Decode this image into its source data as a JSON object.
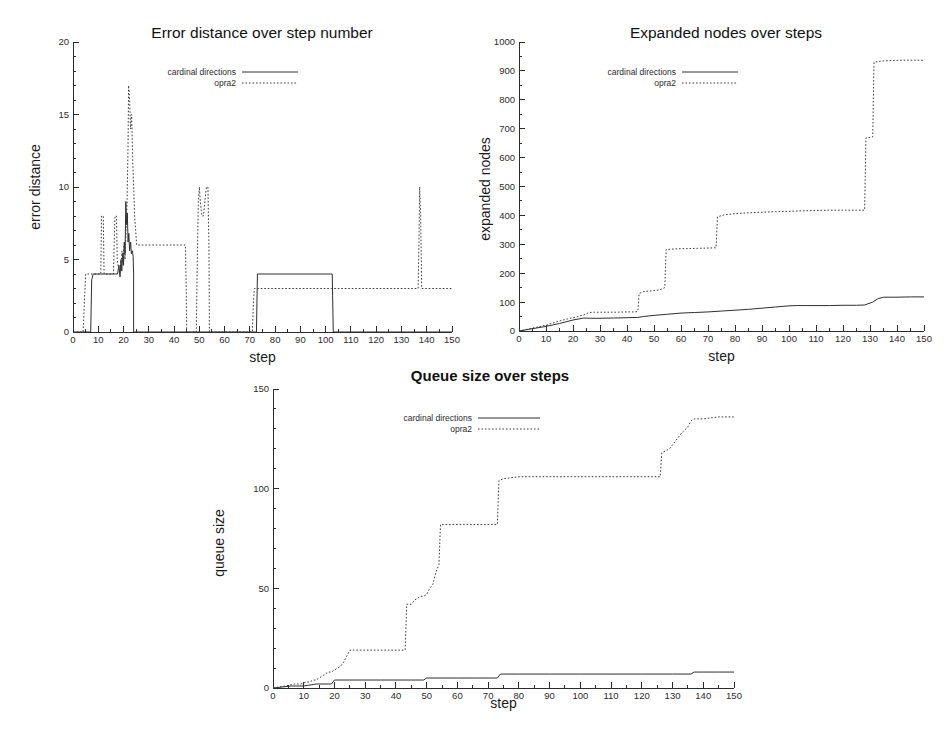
{
  "page": {
    "kind": "figure-sheet",
    "background": "#ffffff",
    "ink_color": "#2b2b2b"
  },
  "legend_common": {
    "entries": [
      {
        "label": "cardinal directions",
        "style": "solid"
      },
      {
        "label": "opra2",
        "style": "dotted"
      }
    ]
  },
  "chart_data": [
    {
      "id": "error-distance",
      "type": "line",
      "title": "Error distance over step number",
      "title_bold": false,
      "xlabel": "step",
      "ylabel": "error distance",
      "xlim": [
        0,
        150
      ],
      "ylim": [
        0,
        20
      ],
      "x_major_step": 10,
      "x_minor_step": 5,
      "y_major_step": 5,
      "y_minor_step": 1,
      "grid": false,
      "legend_position": "top-left",
      "series": [
        {
          "name": "cardinal directions",
          "style": "solid",
          "points": [
            [
              0,
              0
            ],
            [
              7,
              0
            ],
            [
              7.4,
              3.6
            ],
            [
              8,
              4
            ],
            [
              17,
              4
            ],
            [
              17.6,
              4
            ],
            [
              18.2,
              4.6
            ],
            [
              18.6,
              3.8
            ],
            [
              19,
              5
            ],
            [
              19.3,
              4.2
            ],
            [
              19.7,
              5.4
            ],
            [
              20,
              4.6
            ],
            [
              20.3,
              6.2
            ],
            [
              20.6,
              5.4
            ],
            [
              20.9,
              9
            ],
            [
              21.2,
              7.4
            ],
            [
              21.5,
              8.2
            ],
            [
              21.8,
              6.2
            ],
            [
              22.1,
              6.8
            ],
            [
              22.4,
              5.6
            ],
            [
              22.8,
              6.2
            ],
            [
              23.1,
              5.4
            ],
            [
              23.5,
              5.6
            ],
            [
              23.8,
              5.2
            ],
            [
              24,
              4
            ],
            [
              24,
              0
            ],
            [
              72.6,
              0
            ],
            [
              73,
              4
            ],
            [
              102,
              4
            ],
            [
              102.6,
              4
            ],
            [
              103,
              0
            ],
            [
              150,
              0
            ]
          ]
        },
        {
          "name": "opra2",
          "style": "dotted",
          "points": [
            [
              0,
              0
            ],
            [
              4,
              0
            ],
            [
              4.5,
              2
            ],
            [
              5,
              4
            ],
            [
              11,
              4
            ],
            [
              11.3,
              8
            ],
            [
              12,
              8
            ],
            [
              12.3,
              4
            ],
            [
              16,
              4
            ],
            [
              16.3,
              6
            ],
            [
              16.6,
              8
            ],
            [
              17.2,
              8
            ],
            [
              17.5,
              5
            ],
            [
              18,
              4.4
            ],
            [
              18.5,
              4
            ],
            [
              19,
              4.6
            ],
            [
              19.4,
              5.6
            ],
            [
              19.8,
              4.8
            ],
            [
              20.2,
              6
            ],
            [
              20.6,
              5
            ],
            [
              21,
              7
            ],
            [
              21.4,
              9
            ],
            [
              21.8,
              13
            ],
            [
              22,
              17
            ],
            [
              22.4,
              16
            ],
            [
              22.8,
              14
            ],
            [
              23.2,
              15
            ],
            [
              23.6,
              12
            ],
            [
              24,
              10
            ],
            [
              24.4,
              8
            ],
            [
              24.8,
              7
            ],
            [
              25.2,
              6
            ],
            [
              26,
              6
            ],
            [
              44.5,
              6
            ],
            [
              44.8,
              3
            ],
            [
              45,
              0
            ],
            [
              48.8,
              0
            ],
            [
              49.2,
              5
            ],
            [
              49.6,
              9
            ],
            [
              50,
              10
            ],
            [
              50.4,
              9
            ],
            [
              51,
              8
            ],
            [
              51.6,
              8
            ],
            [
              52.2,
              9
            ],
            [
              52.8,
              10
            ],
            [
              53.4,
              10
            ],
            [
              53.8,
              6
            ],
            [
              54,
              0
            ],
            [
              71,
              0
            ],
            [
              71.4,
              2
            ],
            [
              71.8,
              3
            ],
            [
              102.4,
              3
            ],
            [
              136.6,
              3
            ],
            [
              136.9,
              6
            ],
            [
              137.2,
              10
            ],
            [
              137.6,
              8
            ],
            [
              138,
              3
            ],
            [
              150,
              3
            ]
          ]
        }
      ]
    },
    {
      "id": "expanded-nodes",
      "type": "line",
      "title": "Expanded nodes over steps",
      "title_bold": false,
      "xlabel": "step",
      "ylabel": "expanded nodes",
      "xlim": [
        0,
        150
      ],
      "ylim": [
        0,
        1000
      ],
      "x_major_step": 10,
      "x_minor_step": 5,
      "y_major_step": 100,
      "y_minor_step": 50,
      "grid": false,
      "legend_position": "top-left",
      "series": [
        {
          "name": "cardinal directions",
          "style": "solid",
          "points": [
            [
              0,
              0
            ],
            [
              5,
              8
            ],
            [
              10,
              16
            ],
            [
              15,
              26
            ],
            [
              20,
              38
            ],
            [
              24,
              45
            ],
            [
              26,
              44
            ],
            [
              30,
              44
            ],
            [
              35,
              45
            ],
            [
              40,
              46
            ],
            [
              44,
              47
            ],
            [
              46,
              50
            ],
            [
              50,
              54
            ],
            [
              55,
              58
            ],
            [
              60,
              62
            ],
            [
              65,
              64
            ],
            [
              70,
              66
            ],
            [
              75,
              69
            ],
            [
              80,
              72
            ],
            [
              85,
              75
            ],
            [
              90,
              79
            ],
            [
              95,
              83
            ],
            [
              100,
              87
            ],
            [
              103,
              88
            ],
            [
              106,
              88
            ],
            [
              110,
              88
            ],
            [
              115,
              88
            ],
            [
              120,
              89
            ],
            [
              125,
              89
            ],
            [
              128,
              90
            ],
            [
              131,
              100
            ],
            [
              133,
              112
            ],
            [
              135,
              117
            ],
            [
              140,
              117
            ],
            [
              145,
              118
            ],
            [
              150,
              118
            ]
          ]
        },
        {
          "name": "opra2",
          "style": "dotted",
          "points": [
            [
              0,
              0
            ],
            [
              5,
              10
            ],
            [
              10,
              20
            ],
            [
              14,
              32
            ],
            [
              18,
              42
            ],
            [
              21,
              48
            ],
            [
              24,
              56
            ],
            [
              26,
              64
            ],
            [
              28,
              65
            ],
            [
              32,
              65
            ],
            [
              36,
              65
            ],
            [
              40,
              66
            ],
            [
              43,
              66
            ],
            [
              44,
              68
            ],
            [
              44.5,
              130
            ],
            [
              46,
              136
            ],
            [
              48,
              138
            ],
            [
              50,
              140
            ],
            [
              52,
              142
            ],
            [
              54,
              150
            ],
            [
              54.5,
              282
            ],
            [
              58,
              284
            ],
            [
              62,
              285
            ],
            [
              66,
              286
            ],
            [
              70,
              287
            ],
            [
              73,
              288
            ],
            [
              73.5,
              395
            ],
            [
              76,
              402
            ],
            [
              80,
              406
            ],
            [
              85,
              409
            ],
            [
              90,
              411
            ],
            [
              95,
              413
            ],
            [
              100,
              414
            ],
            [
              105,
              416
            ],
            [
              110,
              417
            ],
            [
              115,
              418
            ],
            [
              120,
              418
            ],
            [
              125,
              418
            ],
            [
              128,
              418
            ],
            [
              128.5,
              668
            ],
            [
              130,
              670
            ],
            [
              131,
              672
            ],
            [
              131.5,
              930
            ],
            [
              134,
              934
            ],
            [
              138,
              936
            ],
            [
              142,
              937
            ],
            [
              146,
              937
            ],
            [
              150,
              937
            ]
          ]
        }
      ]
    },
    {
      "id": "queue-size",
      "type": "line",
      "title": "Queue size over steps",
      "title_bold": true,
      "xlabel": "step",
      "ylabel": "queue size",
      "xlim": [
        0,
        150
      ],
      "ylim": [
        0,
        150
      ],
      "x_major_step": 10,
      "x_minor_step": 5,
      "y_major_step": 50,
      "y_minor_step": 10,
      "grid": false,
      "legend_position": "top-left",
      "series": [
        {
          "name": "cardinal directions",
          "style": "solid",
          "points": [
            [
              0,
              0
            ],
            [
              6,
              1
            ],
            [
              10,
              1
            ],
            [
              14,
              2
            ],
            [
              18,
              2
            ],
            [
              19,
              2
            ],
            [
              20,
              4
            ],
            [
              25,
              4
            ],
            [
              30,
              4
            ],
            [
              35,
              4
            ],
            [
              40,
              4
            ],
            [
              45,
              4
            ],
            [
              49,
              4
            ],
            [
              50,
              5
            ],
            [
              55,
              5
            ],
            [
              60,
              5
            ],
            [
              65,
              5
            ],
            [
              70,
              5
            ],
            [
              73,
              5
            ],
            [
              74,
              7
            ],
            [
              80,
              7
            ],
            [
              90,
              7
            ],
            [
              100,
              7
            ],
            [
              110,
              7
            ],
            [
              120,
              7
            ],
            [
              130,
              7
            ],
            [
              136,
              7
            ],
            [
              137,
              8
            ],
            [
              140,
              8
            ],
            [
              145,
              8
            ],
            [
              150,
              8
            ]
          ]
        },
        {
          "name": "opra2",
          "style": "dotted",
          "points": [
            [
              0,
              0
            ],
            [
              4,
              1
            ],
            [
              7,
              2
            ],
            [
              9,
              2
            ],
            [
              11,
              3
            ],
            [
              12,
              3
            ],
            [
              13,
              4
            ],
            [
              14,
              4
            ],
            [
              15,
              5
            ],
            [
              16,
              6
            ],
            [
              17,
              7
            ],
            [
              18,
              8
            ],
            [
              19,
              8
            ],
            [
              20,
              9
            ],
            [
              21,
              10
            ],
            [
              22,
              11
            ],
            [
              23,
              13
            ],
            [
              24,
              16
            ],
            [
              25,
              19
            ],
            [
              26,
              19
            ],
            [
              30,
              19
            ],
            [
              35,
              19
            ],
            [
              40,
              19
            ],
            [
              43,
              19
            ],
            [
              43.5,
              42
            ],
            [
              45,
              42
            ],
            [
              46,
              44
            ],
            [
              47,
              45
            ],
            [
              48,
              46
            ],
            [
              49,
              46
            ],
            [
              50,
              47
            ],
            [
              51,
              50
            ],
            [
              52,
              52
            ],
            [
              53,
              58
            ],
            [
              54,
              62
            ],
            [
              54.5,
              82
            ],
            [
              58,
              82
            ],
            [
              62,
              82
            ],
            [
              66,
              82
            ],
            [
              70,
              82
            ],
            [
              73,
              82
            ],
            [
              73.5,
              104
            ],
            [
              75,
              105
            ],
            [
              80,
              106
            ],
            [
              90,
              106
            ],
            [
              100,
              106
            ],
            [
              110,
              106
            ],
            [
              120,
              106
            ],
            [
              126,
              106
            ],
            [
              126.5,
              118
            ],
            [
              129,
              120
            ],
            [
              131,
              124
            ],
            [
              133,
              128
            ],
            [
              135,
              131
            ],
            [
              136,
              134
            ],
            [
              137,
              135
            ],
            [
              140,
              135
            ],
            [
              145,
              136
            ],
            [
              150,
              136
            ]
          ]
        }
      ]
    }
  ]
}
